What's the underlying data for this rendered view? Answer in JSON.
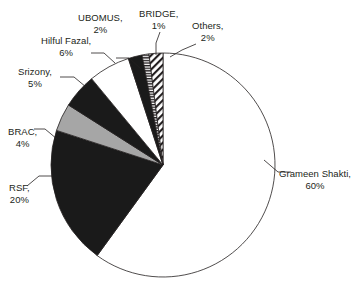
{
  "chart_data": {
    "type": "pie",
    "title": "",
    "subtitle": "",
    "xlabel": "",
    "ylabel": "",
    "legend_position": "none",
    "grid": false,
    "labels_show_percent": true,
    "categories": [
      "Grameen Shakti",
      "RSF",
      "Hilful Fazal",
      "Srizony",
      "BRAC",
      "Others",
      "UBOMUS",
      "BRIDGE"
    ],
    "values": [
      60,
      20,
      6,
      5,
      4,
      2,
      2,
      1
    ],
    "slices": [
      {
        "name": "Grameen Shakti",
        "label": "Grameen Shakti,",
        "percent_label": "60%",
        "value": 60,
        "fill": "white",
        "fill_color": "#ffffff",
        "stroke_color": "#231f20",
        "start_angle": 0,
        "end_angle": 216
      },
      {
        "name": "RSF",
        "label": "RSF,",
        "percent_label": "20%",
        "value": 20,
        "fill": "solid-black",
        "fill_color": "#1a1a1a",
        "stroke_color": "#231f20",
        "start_angle": 216,
        "end_angle": 288
      },
      {
        "name": "BRAC",
        "label": "BRAC,",
        "percent_label": "4%",
        "value": 4,
        "fill": "solid-gray",
        "fill_color": "#a6a6a6",
        "stroke_color": "#231f20",
        "start_angle": 288,
        "end_angle": 302.4
      },
      {
        "name": "Srizony",
        "label": "Srizony,",
        "percent_label": "5%",
        "value": 5,
        "fill": "solid-black",
        "fill_color": "#1a1a1a",
        "stroke_color": "#231f20",
        "start_angle": 302.4,
        "end_angle": 320.4
      },
      {
        "name": "Hilful Fazal",
        "label": "Hilful Fazal,",
        "percent_label": "6%",
        "value": 6,
        "fill": "white",
        "fill_color": "#ffffff",
        "stroke_color": "#231f20",
        "start_angle": 320.4,
        "end_angle": 342
      },
      {
        "name": "UBOMUS",
        "label": "UBOMUS,",
        "percent_label": "2%",
        "value": 2,
        "fill": "solid-black",
        "fill_color": "#1a1a1a",
        "stroke_color": "#231f20",
        "start_angle": 342,
        "end_angle": 349.2
      },
      {
        "name": "BRIDGE",
        "label": "BRIDGE,",
        "percent_label": "1%",
        "value": 1,
        "fill": "horizontal-stripes",
        "fill_color": "#ffffff",
        "stroke_color": "#231f20",
        "start_angle": 349.2,
        "end_angle": 352.8
      },
      {
        "name": "Others",
        "label": "Others,",
        "percent_label": "2%",
        "value": 2,
        "fill": "diagonal-hatch",
        "fill_color": "#ffffff",
        "stroke_color": "#231f20",
        "start_angle": 352.8,
        "end_angle": 360
      }
    ],
    "total": 100,
    "units": "percent",
    "geometry": {
      "center_x": 163,
      "center_y": 165,
      "radius": 112
    }
  }
}
